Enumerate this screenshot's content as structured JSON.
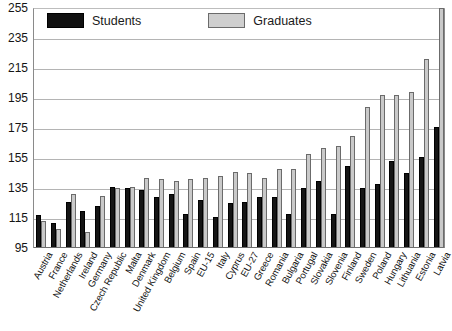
{
  "legend": {
    "students_label": "Students",
    "graduates_label": "Graduates",
    "students_color": "#151515",
    "graduates_color": "#c9c9c9"
  },
  "chart_data": {
    "type": "bar",
    "title": "",
    "subtitle": "",
    "xlabel": "",
    "ylabel": "",
    "ylim": [
      95,
      255
    ],
    "yticks": [
      95,
      115,
      135,
      155,
      175,
      195,
      215,
      235,
      255
    ],
    "grid": true,
    "legend_position": "top-left",
    "categories": [
      "Austria",
      "France",
      "Netherlands",
      "Ireland",
      "Germany",
      "Czech Republic",
      "Malta",
      "Denmark",
      "United Kingdom",
      "Belgium",
      "Spain",
      "EU-15",
      "Italy",
      "Cyprus",
      "EU-27",
      "Greece",
      "Romania",
      "Bulgaria",
      "Portugal",
      "Slovakia",
      "Slovenia",
      "Finland",
      "Sweden",
      "Poland",
      "Hungary",
      "Lithuania",
      "Estonia",
      "Latvia"
    ],
    "series": [
      {
        "name": "Students",
        "color": "#151515",
        "values": [
          117,
          112,
          126,
          120,
          123,
          136,
          135,
          134,
          129,
          131,
          118,
          127,
          116,
          125,
          126,
          129,
          129,
          118,
          135,
          140,
          118,
          150,
          135,
          138,
          153,
          145,
          156,
          176
        ]
      },
      {
        "name": "Graduates",
        "color": "#c9c9c9",
        "values": [
          113,
          108,
          131,
          106,
          130,
          135,
          136,
          142,
          141,
          140,
          141,
          142,
          143,
          146,
          145,
          142,
          148,
          148,
          158,
          162,
          163,
          170,
          189,
          197,
          197,
          199,
          221,
          255
        ]
      }
    ]
  }
}
